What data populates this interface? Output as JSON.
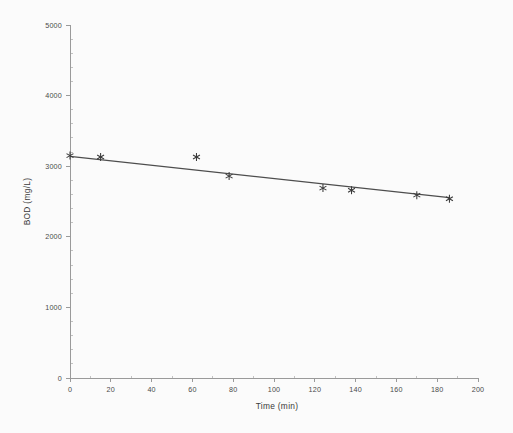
{
  "figure": {
    "background_color": "#fbfbfb",
    "axis_color": "#9a9a9a",
    "marker_color": "#3a3a3a",
    "line_color": "#4d4d4d",
    "width": 513,
    "height": 433
  },
  "chart_data": {
    "type": "scatter",
    "title": "",
    "xlabel": "Time (min)",
    "ylabel": "BOD (mg/L)",
    "xlim": [
      0,
      200
    ],
    "ylim": [
      0,
      5000
    ],
    "xticks": [
      0,
      20,
      40,
      60,
      80,
      100,
      120,
      140,
      160,
      180,
      200
    ],
    "xticklabels": [
      "0",
      "20",
      "40",
      "60",
      "80",
      "100",
      "120",
      "140",
      "160",
      "180",
      "200"
    ],
    "yticks": [
      0,
      1000,
      2000,
      3000,
      4000,
      5000
    ],
    "yticklabels": [
      "0",
      "1000",
      "2000",
      "3000",
      "4000",
      "5000"
    ],
    "grid": false,
    "legend": false,
    "marker_style": "asterisk",
    "series": [
      {
        "name": "BOD measurements",
        "marker": "asterisk",
        "x": [
          0,
          15,
          62,
          78,
          124,
          138,
          170,
          186
        ],
        "y": [
          3150,
          3130,
          3130,
          2860,
          2690,
          2660,
          2590,
          2540
        ]
      }
    ],
    "trendline": {
      "type": "linear",
      "x": [
        0,
        186
      ],
      "y": [
        3140,
        2555
      ]
    }
  }
}
